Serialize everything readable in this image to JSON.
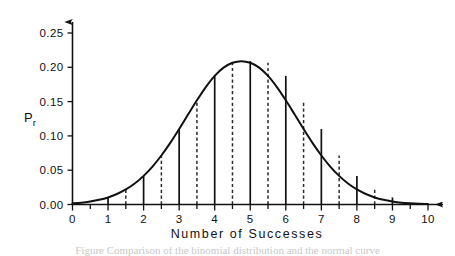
{
  "figure": {
    "axis_title_x": "Number  of  Successes",
    "axis_title_y_main": "P",
    "axis_title_y_sub": "r",
    "caption_partial": "Figure  Comparison of the binomial distribution and the normal curve"
  },
  "chart_data": {
    "type": "line",
    "title": "",
    "subtitle": "",
    "xlabel": "Number of Successes",
    "ylabel": "Pr",
    "xlim": [
      0,
      10
    ],
    "ylim": [
      0.0,
      0.25
    ],
    "grid": false,
    "legend": null,
    "x_tick_labels": [
      "0",
      "1",
      "2",
      "3",
      "4",
      "5",
      "6",
      "7",
      "8",
      "9",
      "10"
    ],
    "x_tick_values": [
      0,
      1,
      2,
      3,
      4,
      5,
      6,
      7,
      8,
      9,
      10
    ],
    "x_minor_tick_values": [
      0.5,
      1.5,
      2.5,
      3.5,
      4.5,
      5.5,
      6.5,
      7.5,
      8.5,
      9.5
    ],
    "y_tick_labels": [
      "0.00",
      "0.05",
      "0.10",
      "0.15",
      "0.20",
      "0.25"
    ],
    "y_tick_values": [
      0.0,
      0.05,
      0.1,
      0.15,
      0.2,
      0.25
    ],
    "curve": {
      "name": "normal approximation curve",
      "x": [
        0.0,
        0.25,
        0.5,
        0.75,
        1.0,
        1.25,
        1.5,
        1.75,
        2.0,
        2.25,
        2.5,
        2.75,
        3.0,
        3.25,
        3.5,
        3.75,
        4.0,
        4.25,
        4.5,
        4.75,
        5.0,
        5.25,
        5.5,
        5.75,
        6.0,
        6.25,
        6.5,
        6.75,
        7.0,
        7.25,
        7.5,
        7.75,
        8.0,
        8.25,
        8.5,
        8.75,
        9.0,
        9.25,
        9.5,
        9.75,
        10.0
      ],
      "y": [
        0.0017,
        0.0027,
        0.0044,
        0.0068,
        0.0103,
        0.0153,
        0.0219,
        0.0306,
        0.0417,
        0.0553,
        0.0714,
        0.0898,
        0.11,
        0.1311,
        0.1519,
        0.1712,
        0.1875,
        0.1995,
        0.2066,
        0.209,
        0.2066,
        0.1995,
        0.1875,
        0.1712,
        0.1519,
        0.1311,
        0.11,
        0.0898,
        0.0714,
        0.0553,
        0.0417,
        0.0306,
        0.0219,
        0.0153,
        0.0103,
        0.0068,
        0.0044,
        0.0027,
        0.0017,
        0.001,
        0.0006
      ]
    },
    "solid_ordinates": {
      "note": "vertical solid lines at integer successes, height read off the curve",
      "x": [
        0,
        1,
        2,
        3,
        4,
        5,
        6,
        7,
        8,
        9,
        10
      ],
      "y": [
        0.0017,
        0.0103,
        0.0417,
        0.11,
        0.1875,
        0.209,
        0.1875,
        0.11,
        0.0417,
        0.0103,
        0.0017
      ]
    },
    "dashed_ordinates": {
      "note": "vertical dashed lines at half-integer midpoints, height read off the curve",
      "x": [
        0.5,
        1.5,
        2.5,
        3.5,
        4.5,
        5.5,
        6.5,
        7.5,
        8.5,
        9.5
      ],
      "y": [
        0.0044,
        0.0219,
        0.0714,
        0.1519,
        0.2066,
        0.2066,
        0.1519,
        0.0714,
        0.0219,
        0.0044
      ]
    },
    "peak": {
      "x": 5,
      "y": 0.25,
      "label": "0.25"
    }
  },
  "colors": {
    "ink": "#111111",
    "background": "#ffffff",
    "dashed": "#2b2b2b"
  }
}
